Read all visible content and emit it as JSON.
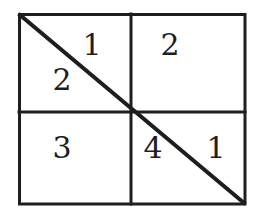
{
  "diagram": {
    "colors": {
      "stroke": "#1e1e1e",
      "background": "#ffffff",
      "text": "#1e1e1e"
    },
    "grid": {
      "rows": 2,
      "cols": 2,
      "outer_box": {
        "x1": 19,
        "y1": 14,
        "x2": 245,
        "y2": 204
      },
      "vertical_divider_x": 131,
      "horizontal_divider_y": 112,
      "diagonal": {
        "from": "top-left",
        "to": "bottom-right"
      }
    },
    "labels": {
      "top_left_upper": "1",
      "top_left_lower": "2",
      "top_right": "2",
      "bottom_left": "3",
      "bottom_right_lower_left": "4",
      "bottom_right_upper_right": "1"
    }
  }
}
